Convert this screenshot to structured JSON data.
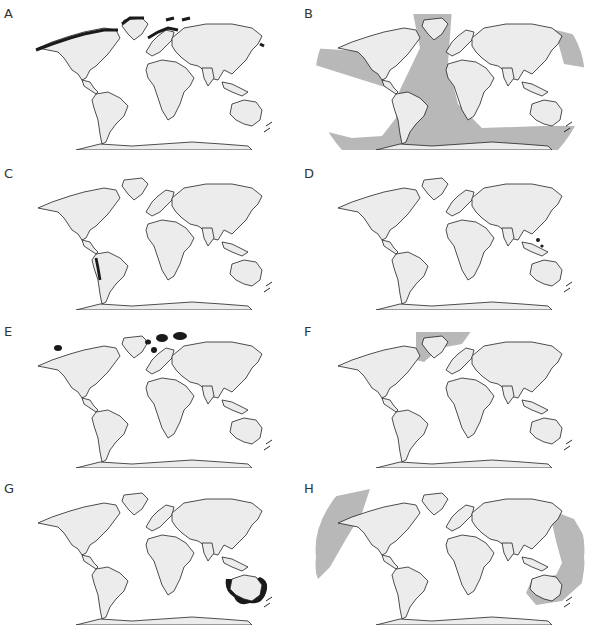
{
  "figure": {
    "projection": "Robinson-like world map",
    "palette": {
      "land": "#ececec",
      "coastline": "#222222",
      "range_dark": "#1a1a1a",
      "range_light": "#b8b8b8",
      "background": "#ffffff"
    },
    "panels": [
      {
        "label": "A",
        "highlight": "dark",
        "region": "Arctic coasts of North America, Greenland, northern Europe and Siberia, Bering/Okhotsk"
      },
      {
        "label": "B",
        "highlight": "light",
        "region": "Atlantic Ocean, Southern Ocean belt, North Pacific and eastern Pacific"
      },
      {
        "label": "C",
        "highlight": "dark",
        "region": "Western coast of South America (Peru/Chile)"
      },
      {
        "label": "D",
        "highlight": "none",
        "region": "Philippines / Indonesian archipelago (small dark spots)"
      },
      {
        "label": "E",
        "highlight": "dark",
        "region": "Svalbard, Franz Josef Land, Novaya Zemlya, Alaska spots"
      },
      {
        "label": "F",
        "highlight": "light",
        "region": "North Atlantic between Greenland, Iceland and Norway"
      },
      {
        "label": "G",
        "highlight": "dark",
        "region": "Southern and eastern Australia coastal waters"
      },
      {
        "label": "H",
        "highlight": "light",
        "region": "Northeast Pacific and western Pacific/eastern Australia"
      }
    ]
  }
}
